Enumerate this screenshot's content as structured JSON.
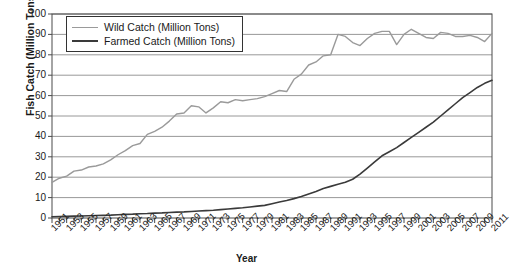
{
  "chart_data": {
    "type": "line",
    "title": "",
    "xlabel": "Year",
    "ylabel": "Fish Catch (Million Tons)",
    "xlim": [
      1951,
      2011
    ],
    "ylim": [
      0,
      100
    ],
    "ytick_labels": [
      "0",
      "10",
      "20",
      "30",
      "40",
      "50",
      "60",
      "70",
      "80",
      "90",
      "100"
    ],
    "ytick_values": [
      0,
      10,
      20,
      30,
      40,
      50,
      60,
      70,
      80,
      90,
      100
    ],
    "xtick_labels": [
      "1951",
      "1953",
      "1955",
      "1957",
      "1959",
      "1961",
      "1963",
      "1965",
      "1967",
      "1969",
      "1971",
      "1973",
      "1975",
      "1977",
      "1979",
      "1981",
      "1983",
      "1985",
      "1987",
      "1989",
      "1991",
      "1993",
      "1995",
      "1997",
      "1999",
      "2001",
      "2003",
      "2005",
      "2007",
      "2009",
      "2011"
    ],
    "xtick_values": [
      1951,
      1953,
      1955,
      1957,
      1959,
      1961,
      1963,
      1965,
      1967,
      1969,
      1971,
      1973,
      1975,
      1977,
      1979,
      1981,
      1983,
      1985,
      1987,
      1989,
      1991,
      1993,
      1995,
      1997,
      1999,
      2001,
      2003,
      2005,
      2007,
      2009,
      2011
    ],
    "minor_tick_step": 1,
    "grid": "horizontal",
    "legend_position": "top-left-inside",
    "x": [
      1951,
      1952,
      1953,
      1954,
      1955,
      1956,
      1957,
      1958,
      1959,
      1960,
      1961,
      1962,
      1963,
      1964,
      1965,
      1966,
      1967,
      1968,
      1969,
      1970,
      1971,
      1972,
      1973,
      1974,
      1975,
      1976,
      1977,
      1978,
      1979,
      1980,
      1981,
      1982,
      1983,
      1984,
      1985,
      1986,
      1987,
      1988,
      1989,
      1990,
      1991,
      1992,
      1993,
      1994,
      1995,
      1996,
      1997,
      1998,
      1999,
      2000,
      2001,
      2002,
      2003,
      2004,
      2005,
      2006,
      2007,
      2008,
      2009,
      2010,
      2011
    ],
    "series": [
      {
        "name": "Wild Catch (Million Tons)",
        "color": "#9a9a9a",
        "width": 1.4,
        "values": [
          17.5,
          19.5,
          20.5,
          23.0,
          23.5,
          25.0,
          25.5,
          26.5,
          28.5,
          31.0,
          33.0,
          35.5,
          36.5,
          41.0,
          42.5,
          44.5,
          47.5,
          51.0,
          51.5,
          55.0,
          54.5,
          51.5,
          54.0,
          57.0,
          56.5,
          58.0,
          57.5,
          58.0,
          58.5,
          59.5,
          61.0,
          62.5,
          62.0,
          68.0,
          70.5,
          75.0,
          76.5,
          79.5,
          80.0,
          90.0,
          89.0,
          86.0,
          84.5,
          88.0,
          90.5,
          91.5,
          91.5,
          85.0,
          90.0,
          92.5,
          90.5,
          88.5,
          88.0,
          91.0,
          90.5,
          89.0,
          89.0,
          89.5,
          88.5,
          86.5,
          90.5
        ]
      },
      {
        "name": "Farmed Catch (Million Tons)",
        "color": "#3a3a3a",
        "width": 1.6,
        "values": [
          0.6,
          0.7,
          0.8,
          0.9,
          1.0,
          1.1,
          1.2,
          1.3,
          1.4,
          1.6,
          1.8,
          1.9,
          2.1,
          2.2,
          2.4,
          2.5,
          2.7,
          2.9,
          3.0,
          3.2,
          3.4,
          3.6,
          3.8,
          4.1,
          4.4,
          4.7,
          5.0,
          5.4,
          5.8,
          6.2,
          7.0,
          7.8,
          8.6,
          9.5,
          10.5,
          11.8,
          13.0,
          14.5,
          15.5,
          16.5,
          17.5,
          19.0,
          21.5,
          24.5,
          27.5,
          30.5,
          32.5,
          34.5,
          37.0,
          39.5,
          42.0,
          44.5,
          47.0,
          50.0,
          53.0,
          56.0,
          59.0,
          61.5,
          64.0,
          66.0,
          67.5
        ]
      }
    ]
  }
}
